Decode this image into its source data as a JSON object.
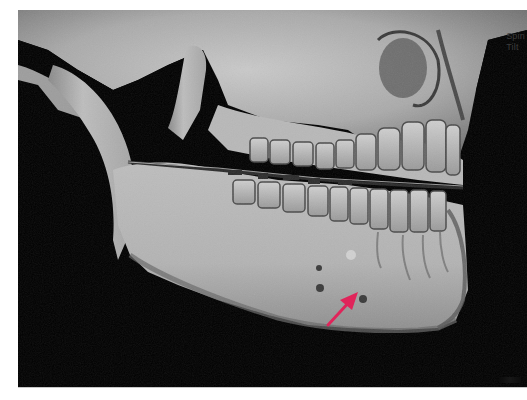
{
  "figure": {
    "background_color": "#000000",
    "page_color": "#ffffff"
  },
  "viewport": {
    "overlay_labels": [
      {
        "text": "Spin"
      },
      {
        "text": "Tilt"
      }
    ],
    "overlay_label_color": "#3c3c3c"
  },
  "annotations": {
    "arrow": {
      "color": "#e0245a",
      "direction": "up-right",
      "target": "mandibular foramen / cortical defect near inferior border",
      "start": [
        328,
        325
      ],
      "end": [
        358,
        292
      ]
    }
  },
  "icons": {
    "arrow_annotation": "arrow-up-right-icon"
  }
}
